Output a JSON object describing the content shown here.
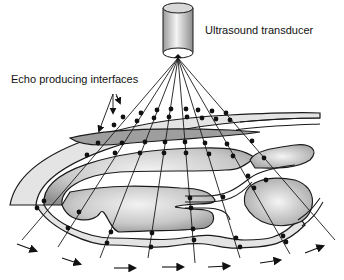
{
  "labels": {
    "transducer": "Ultrasound transducer",
    "interfaces": "Echo producing interfaces"
  },
  "colors": {
    "line": "#1a1a1a",
    "tissue_light": "#e6e6e6",
    "tissue_dark": "#9a9a9a",
    "background": "#ffffff"
  },
  "icons": {
    "transducer": "transducer-cylinder-icon",
    "echo_arrows": "double-arrow-icon",
    "wave_arrows": "right-arrow-icon"
  }
}
